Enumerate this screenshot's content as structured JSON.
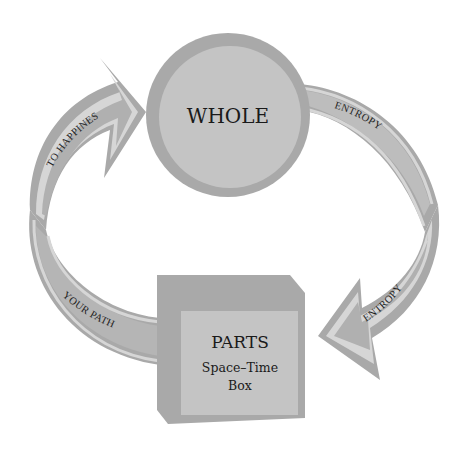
{
  "diagram": {
    "type": "cycle",
    "nodes": {
      "whole": {
        "title": "WHOLE",
        "shape": "circle"
      },
      "parts": {
        "title": "PARTS",
        "subtitle_line1": "Space–Time",
        "subtitle_line2": "Box",
        "shape": "cube"
      }
    },
    "arrows": {
      "top_right": {
        "label": "ENTROPY",
        "from": "WHOLE",
        "direction": "clockwise"
      },
      "right_down": {
        "label": "ENTROPY",
        "to": "PARTS",
        "direction": "clockwise"
      },
      "bottom_left": {
        "label": "YOUR PATH",
        "from": "PARTS"
      },
      "left_up": {
        "label": "TO HAPPINES",
        "to": "WHOLE"
      }
    },
    "colors": {
      "background": "#ffffff",
      "outer_gray": "#a9a9a9",
      "inner_gray": "#c4c4c4",
      "band_fill": "#b0b0b0",
      "band_highlight": "#d6d6d6",
      "text": "#1a1a1a"
    }
  }
}
